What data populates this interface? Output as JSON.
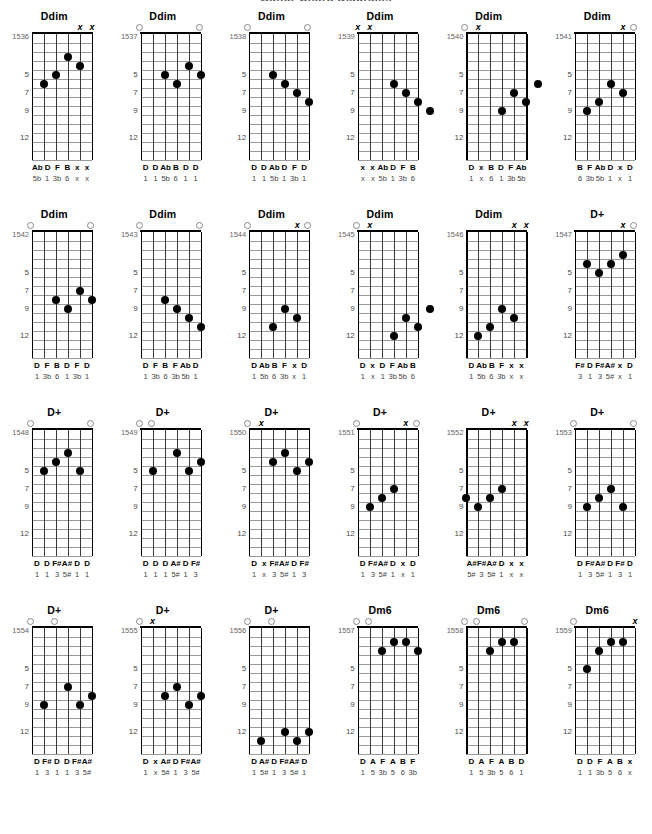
{
  "page": {
    "title": "Guitar Chord Diagrams",
    "fret_labels": [
      "5",
      "7",
      "9",
      "12"
    ],
    "fret_label_positions": [
      5,
      7,
      9,
      12
    ],
    "frets_shown": 14,
    "strings": 6
  },
  "chart_data": {
    "type": "table",
    "title": "Guitar Chord Diagrams",
    "columns": 6,
    "rows": 4,
    "diagrams": [
      {
        "id": "1536",
        "name": "Ddim",
        "top_marks": [
          "",
          "",
          "",
          "",
          "x",
          "x"
        ],
        "dots": [
          {
            "string": 1,
            "fret": 6
          },
          {
            "string": 2,
            "fret": 5
          },
          {
            "string": 3,
            "fret": 3
          },
          {
            "string": 4,
            "fret": 4
          }
        ],
        "notes": [
          "Ab",
          "D",
          "F",
          "B",
          "x",
          "x"
        ],
        "intervals": [
          "5b",
          "1",
          "3b",
          "6",
          "x",
          "x"
        ]
      },
      {
        "id": "1537",
        "name": "Ddim",
        "top_marks": [
          "o",
          "",
          "",
          "",
          "",
          "o"
        ],
        "dots": [
          {
            "string": 2,
            "fret": 5
          },
          {
            "string": 3,
            "fret": 6
          },
          {
            "string": 4,
            "fret": 4
          },
          {
            "string": 5,
            "fret": 5
          }
        ],
        "notes": [
          "D",
          "D",
          "Ab",
          "B",
          "D",
          "D"
        ],
        "intervals": [
          "1",
          "1",
          "5b",
          "6",
          "1",
          "1"
        ]
      },
      {
        "id": "1538",
        "name": "Ddim",
        "top_marks": [
          "o",
          "",
          "",
          "",
          "",
          "o"
        ],
        "dots": [
          {
            "string": 2,
            "fret": 5
          },
          {
            "string": 3,
            "fret": 6
          },
          {
            "string": 4,
            "fret": 7
          },
          {
            "string": 5,
            "fret": 8
          }
        ],
        "notes": [
          "D",
          "D",
          "Ab",
          "D",
          "F",
          "D"
        ],
        "intervals": [
          "1",
          "1",
          "5b",
          "1",
          "3b",
          "1"
        ]
      },
      {
        "id": "1539",
        "name": "Ddim",
        "top_marks": [
          "x",
          "x",
          "",
          "",
          "",
          ""
        ],
        "dots": [
          {
            "string": 3,
            "fret": 6
          },
          {
            "string": 4,
            "fret": 7
          },
          {
            "string": 5,
            "fret": 8
          },
          {
            "string": 6,
            "fret": 9
          }
        ],
        "notes": [
          "x",
          "x",
          "Ab",
          "D",
          "F",
          "B"
        ],
        "intervals": [
          "x",
          "x",
          "5b",
          "1",
          "3b",
          "6"
        ]
      },
      {
        "id": "1540",
        "name": "Ddim",
        "top_marks": [
          "o",
          "x",
          "",
          "",
          "",
          ""
        ],
        "dots": [
          {
            "string": 3,
            "fret": 9
          },
          {
            "string": 4,
            "fret": 7
          },
          {
            "string": 5,
            "fret": 8
          },
          {
            "string": 6,
            "fret": 6
          }
        ],
        "notes": [
          "D",
          "x",
          "B",
          "D",
          "F",
          "Ab"
        ],
        "intervals": [
          "1",
          "x",
          "6",
          "1",
          "3b",
          "5b"
        ]
      },
      {
        "id": "1541",
        "name": "Ddim",
        "top_marks": [
          "",
          "",
          "",
          "",
          "x",
          "o"
        ],
        "dots": [
          {
            "string": 1,
            "fret": 9
          },
          {
            "string": 2,
            "fret": 8
          },
          {
            "string": 3,
            "fret": 6
          },
          {
            "string": 4,
            "fret": 7
          }
        ],
        "notes": [
          "B",
          "F",
          "Ab",
          "D",
          "x",
          "D"
        ],
        "intervals": [
          "6",
          "3b",
          "5b",
          "1",
          "x",
          "1"
        ]
      },
      {
        "id": "1542",
        "name": "Ddim",
        "top_marks": [
          "o",
          "",
          "",
          "",
          "",
          "o"
        ],
        "dots": [
          {
            "string": 2,
            "fret": 8
          },
          {
            "string": 3,
            "fret": 9
          },
          {
            "string": 4,
            "fret": 7
          },
          {
            "string": 5,
            "fret": 8
          }
        ],
        "notes": [
          "D",
          "F",
          "B",
          "D",
          "F",
          "D"
        ],
        "intervals": [
          "1",
          "3b",
          "6",
          "1",
          "3b",
          "1"
        ]
      },
      {
        "id": "1543",
        "name": "Ddim",
        "top_marks": [
          "o",
          "",
          "",
          "",
          "",
          "o"
        ],
        "dots": [
          {
            "string": 2,
            "fret": 8
          },
          {
            "string": 3,
            "fret": 9
          },
          {
            "string": 4,
            "fret": 10
          },
          {
            "string": 5,
            "fret": 11
          }
        ],
        "notes": [
          "D",
          "F",
          "B",
          "F",
          "Ab",
          "D"
        ],
        "intervals": [
          "1",
          "3b",
          "6",
          "3b",
          "5b",
          "1"
        ]
      },
      {
        "id": "1544",
        "name": "Ddim",
        "top_marks": [
          "o",
          "",
          "",
          "",
          "x",
          "o"
        ],
        "dots": [
          {
            "string": 2,
            "fret": 11
          },
          {
            "string": 3,
            "fret": 9
          },
          {
            "string": 4,
            "fret": 10
          }
        ],
        "notes": [
          "D",
          "Ab",
          "B",
          "F",
          "x",
          "D"
        ],
        "intervals": [
          "1",
          "5b",
          "6",
          "3b",
          "x",
          "1"
        ]
      },
      {
        "id": "1545",
        "name": "Ddim",
        "top_marks": [
          "o",
          "x",
          "",
          "",
          "",
          ""
        ],
        "dots": [
          {
            "string": 3,
            "fret": 12
          },
          {
            "string": 4,
            "fret": 10
          },
          {
            "string": 5,
            "fret": 11
          },
          {
            "string": 6,
            "fret": 9
          }
        ],
        "notes": [
          "D",
          "x",
          "D",
          "F",
          "Ab",
          "B"
        ],
        "intervals": [
          "1",
          "x",
          "1",
          "3b",
          "5b",
          "6"
        ]
      },
      {
        "id": "1546",
        "name": "Ddim",
        "top_marks": [
          "",
          "",
          "",
          "",
          "x",
          "x"
        ],
        "dots": [
          {
            "string": 1,
            "fret": 12
          },
          {
            "string": 2,
            "fret": 11
          },
          {
            "string": 3,
            "fret": 9
          },
          {
            "string": 4,
            "fret": 10
          }
        ],
        "notes": [
          "D",
          "Ab",
          "B",
          "F",
          "x",
          "x"
        ],
        "intervals": [
          "1",
          "5b",
          "6",
          "3b",
          "x",
          "x"
        ]
      },
      {
        "id": "1547",
        "name": "D+",
        "top_marks": [
          "",
          "",
          "",
          "",
          "x",
          "o"
        ],
        "dots": [
          {
            "string": 1,
            "fret": 4
          },
          {
            "string": 2,
            "fret": 5
          },
          {
            "string": 3,
            "fret": 4
          },
          {
            "string": 4,
            "fret": 3
          }
        ],
        "notes": [
          "F#",
          "D",
          "F#",
          "A#",
          "x",
          "D"
        ],
        "intervals": [
          "3",
          "1",
          "3",
          "5#",
          "x",
          "1"
        ]
      },
      {
        "id": "1548",
        "name": "D+",
        "top_marks": [
          "o",
          "",
          "",
          "",
          "",
          "o"
        ],
        "dots": [
          {
            "string": 1,
            "fret": 5
          },
          {
            "string": 2,
            "fret": 4
          },
          {
            "string": 3,
            "fret": 3
          },
          {
            "string": 4,
            "fret": 5
          }
        ],
        "notes": [
          "D",
          "D",
          "F#",
          "A#",
          "D",
          "D"
        ],
        "intervals": [
          "1",
          "1",
          "3",
          "5#",
          "1",
          "1"
        ]
      },
      {
        "id": "1549",
        "name": "D+",
        "top_marks": [
          "o",
          "o",
          "",
          "",
          "",
          ""
        ],
        "dots": [
          {
            "string": 1,
            "fret": 5
          },
          {
            "string": 3,
            "fret": 3
          },
          {
            "string": 4,
            "fret": 5
          },
          {
            "string": 5,
            "fret": 4
          }
        ],
        "notes": [
          "D",
          "D",
          "D",
          "A#",
          "D",
          "F#"
        ],
        "intervals": [
          "1",
          "1",
          "1",
          "5#",
          "1",
          "3"
        ]
      },
      {
        "id": "1550",
        "name": "D+",
        "top_marks": [
          "o",
          "x",
          "",
          "",
          "",
          ""
        ],
        "dots": [
          {
            "string": 2,
            "fret": 4
          },
          {
            "string": 3,
            "fret": 3
          },
          {
            "string": 4,
            "fret": 5
          },
          {
            "string": 5,
            "fret": 4
          }
        ],
        "notes": [
          "D",
          "x",
          "F#",
          "A#",
          "D",
          "F#"
        ],
        "intervals": [
          "1",
          "x",
          "3",
          "5#",
          "1",
          "3"
        ]
      },
      {
        "id": "1551",
        "name": "D+",
        "top_marks": [
          "o",
          "",
          "",
          "",
          "x",
          "o"
        ],
        "dots": [
          {
            "string": 1,
            "fret": 9
          },
          {
            "string": 2,
            "fret": 8
          },
          {
            "string": 3,
            "fret": 7
          }
        ],
        "notes": [
          "D",
          "F#",
          "A#",
          "D",
          "x",
          "D"
        ],
        "intervals": [
          "1",
          "3",
          "5#",
          "1",
          "x",
          "1"
        ]
      },
      {
        "id": "1552",
        "name": "D+",
        "top_marks": [
          "",
          "",
          "",
          "",
          "x",
          "x"
        ],
        "dots": [
          {
            "string": 0,
            "fret": 8
          },
          {
            "string": 1,
            "fret": 9
          },
          {
            "string": 2,
            "fret": 8
          },
          {
            "string": 3,
            "fret": 7
          }
        ],
        "notes": [
          "A#",
          "F#",
          "A#",
          "D",
          "x",
          "x"
        ],
        "intervals": [
          "5#",
          "3",
          "5#",
          "1",
          "x",
          "x"
        ]
      },
      {
        "id": "1553",
        "name": "D+",
        "top_marks": [
          "o",
          "",
          "",
          "",
          "",
          "o"
        ],
        "dots": [
          {
            "string": 1,
            "fret": 9
          },
          {
            "string": 2,
            "fret": 8
          },
          {
            "string": 3,
            "fret": 7
          },
          {
            "string": 4,
            "fret": 9
          }
        ],
        "notes": [
          "D",
          "F#",
          "A#",
          "D",
          "F#",
          "D"
        ],
        "intervals": [
          "1",
          "3",
          "5#",
          "1",
          "3",
          "1"
        ]
      },
      {
        "id": "1554",
        "name": "D+",
        "top_marks": [
          "o",
          "",
          "o",
          "",
          "",
          ""
        ],
        "dots": [
          {
            "string": 1,
            "fret": 9
          },
          {
            "string": 3,
            "fret": 7
          },
          {
            "string": 4,
            "fret": 9
          },
          {
            "string": 5,
            "fret": 8
          }
        ],
        "notes": [
          "D",
          "F#",
          "D",
          "D",
          "F#",
          "A#"
        ],
        "intervals": [
          "1",
          "3",
          "1",
          "1",
          "3",
          "5#"
        ]
      },
      {
        "id": "1555",
        "name": "D+",
        "top_marks": [
          "o",
          "x",
          "",
          "",
          "",
          ""
        ],
        "dots": [
          {
            "string": 2,
            "fret": 8
          },
          {
            "string": 3,
            "fret": 7
          },
          {
            "string": 4,
            "fret": 9
          },
          {
            "string": 5,
            "fret": 8
          }
        ],
        "notes": [
          "D",
          "x",
          "A#",
          "D",
          "F#",
          "A#"
        ],
        "intervals": [
          "1",
          "x",
          "5#",
          "1",
          "3",
          "5#"
        ]
      },
      {
        "id": "1556",
        "name": "D+",
        "top_marks": [
          "o",
          "",
          "o",
          "",
          "",
          ""
        ],
        "dots": [
          {
            "string": 1,
            "fret": 13
          },
          {
            "string": 3,
            "fret": 12
          },
          {
            "string": 4,
            "fret": 13
          },
          {
            "string": 5,
            "fret": 12
          }
        ],
        "notes": [
          "D",
          "A#",
          "D",
          "F#",
          "A#",
          "D"
        ],
        "intervals": [
          "1",
          "5#",
          "1",
          "3",
          "5#",
          "1"
        ]
      },
      {
        "id": "1557",
        "name": "Dm6",
        "top_marks": [
          "o",
          "o",
          "",
          "",
          "",
          ""
        ],
        "dots": [
          {
            "string": 2,
            "fret": 3
          },
          {
            "string": 3,
            "fret": 2
          },
          {
            "string": 4,
            "fret": 2
          },
          {
            "string": 5,
            "fret": 3
          }
        ],
        "notes": [
          "D",
          "A",
          "F",
          "A",
          "B",
          "F"
        ],
        "intervals": [
          "1",
          "5",
          "3b",
          "5",
          "6",
          "3b"
        ]
      },
      {
        "id": "1558",
        "name": "Dm6",
        "top_marks": [
          "o",
          "o",
          "",
          "",
          "",
          "o"
        ],
        "dots": [
          {
            "string": 2,
            "fret": 3
          },
          {
            "string": 3,
            "fret": 2
          },
          {
            "string": 4,
            "fret": 2
          }
        ],
        "notes": [
          "D",
          "A",
          "F",
          "A",
          "B",
          "D"
        ],
        "intervals": [
          "1",
          "5",
          "3b",
          "5",
          "6",
          "1"
        ]
      },
      {
        "id": "1559",
        "name": "Dm6",
        "top_marks": [
          "o",
          "",
          "",
          "",
          "",
          "x"
        ],
        "dots": [
          {
            "string": 1,
            "fret": 5
          },
          {
            "string": 2,
            "fret": 3
          },
          {
            "string": 3,
            "fret": 2
          },
          {
            "string": 4,
            "fret": 2
          }
        ],
        "notes": [
          "D",
          "D",
          "F",
          "A",
          "B",
          "x"
        ],
        "intervals": [
          "1",
          "1",
          "3b",
          "5",
          "6",
          "x"
        ]
      }
    ]
  }
}
